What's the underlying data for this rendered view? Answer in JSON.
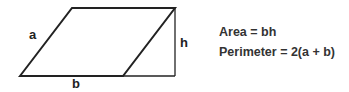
{
  "diagram": {
    "labels": {
      "side": "a",
      "height": "h",
      "base": "b"
    },
    "formulas": {
      "area": "Area = bh",
      "perimeter": "Perimeter = 2(a + b)"
    },
    "colors": {
      "stroke": "#222222",
      "text": "#333333"
    }
  }
}
